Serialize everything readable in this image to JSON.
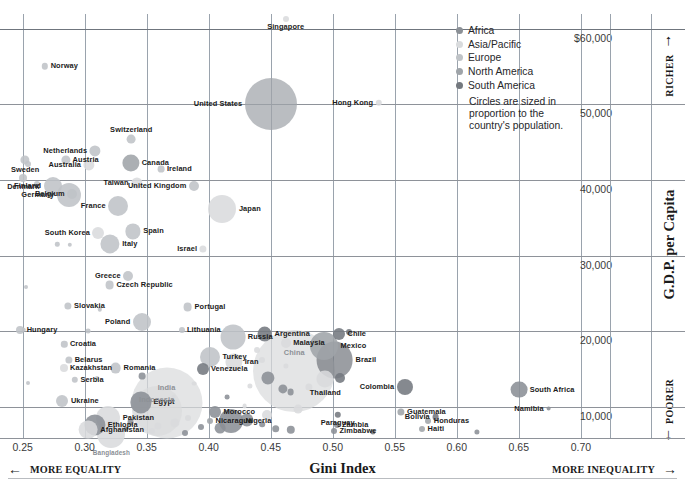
{
  "chart_data": {
    "type": "scatter",
    "title": "",
    "xlabel": "Gini Index",
    "ylabel": "G.D.P. per Capita",
    "xlim": [
      0.2317,
      0.7235
    ],
    "ylim": [
      5900,
      61930
    ],
    "xticks": [
      0.25,
      0.3,
      0.35,
      0.4,
      0.45,
      0.5,
      0.55,
      0.6,
      0.65,
      0.7
    ],
    "xticklabels": [
      "0.25",
      "0.30",
      "0.35",
      "0.40",
      "0.45",
      "0.50",
      "0.55",
      "0.60",
      "0.65",
      "0.70"
    ],
    "yticks": [
      60000,
      50000,
      40000,
      30000,
      20000,
      10000
    ],
    "yticklabels": [
      "$60,000",
      "50,000",
      "40,000",
      "30,000",
      "20,000",
      "10,000"
    ],
    "grid": true,
    "legend_position": "top-right",
    "size_note": "Circles are sized in proportion to the country's population.",
    "left_direction": "MORE EQUALITY",
    "right_direction": "MORE INEQUALITY",
    "top_direction": "RICHER",
    "bottom_direction": "POORER",
    "series": [
      {
        "name": "Africa",
        "color": "#8b9096"
      },
      {
        "name": "Asia/Pacific",
        "color": "#d9dbdd"
      },
      {
        "name": "Europe",
        "color": "#bfc3c7"
      },
      {
        "name": "North America",
        "color": "#9fa4a9"
      },
      {
        "name": "South America",
        "color": "#74797f"
      }
    ],
    "points": [
      {
        "name": "Singapore",
        "x": 0.462,
        "y": 61300,
        "r": 3.0,
        "g": "Asia/Pacific",
        "lp": "below",
        "i": false
      },
      {
        "name": "Norway",
        "x": 0.268,
        "y": 55000,
        "r": 3.2,
        "g": "Europe",
        "lp": "right",
        "i": false
      },
      {
        "name": "United States",
        "x": 0.45,
        "y": 50000,
        "r": 26.0,
        "g": "North America",
        "lp": "left",
        "i": false
      },
      {
        "name": "Hong Kong",
        "x": 0.537,
        "y": 50200,
        "r": 3.2,
        "g": "Asia/Pacific",
        "lp": "left",
        "i": false
      },
      {
        "name": "Switzerland",
        "x": 0.3375,
        "y": 45400,
        "r": 4.4,
        "g": "Europe",
        "lp": "above",
        "i": false
      },
      {
        "name": "Netherlands",
        "x": 0.3085,
        "y": 43800,
        "r": 5.6,
        "g": "Europe",
        "lp": "left",
        "i": false
      },
      {
        "name": "Austria",
        "x": 0.2845,
        "y": 42700,
        "r": 4.6,
        "g": "Europe",
        "lp": "right",
        "i": false
      },
      {
        "name": "Canada",
        "x": 0.337,
        "y": 42300,
        "r": 8.6,
        "g": "North America",
        "lp": "right",
        "i": false
      },
      {
        "name": "Sweden",
        "x": 0.252,
        "y": 42600,
        "r": 4.6,
        "g": "Europe",
        "lp": "below",
        "i": false
      },
      {
        "name": "Australia",
        "x": 0.3035,
        "y": 42000,
        "r": 5.6,
        "g": "Asia/Pacific",
        "lp": "left",
        "i": false
      },
      {
        "name": "Ireland",
        "x": 0.3615,
        "y": 41400,
        "r": 3.4,
        "g": "Europe",
        "lp": "right",
        "i": false
      },
      {
        "name": "Denmark",
        "x": 0.2505,
        "y": 40200,
        "r": 4.0,
        "g": "Europe",
        "lp": "below",
        "i": false
      },
      {
        "name": "Finland",
        "x": 0.274,
        "y": 39200,
        "r": 9.0,
        "g": "Europe",
        "lp": "left",
        "i": false
      },
      {
        "name": "Taiwan",
        "x": 0.342,
        "y": 39600,
        "r": 5.6,
        "g": "Asia/Pacific",
        "lp": "left",
        "i": false
      },
      {
        "name": "United Kingdom",
        "x": 0.388,
        "y": 39200,
        "r": 5.0,
        "g": "Europe",
        "lp": "left",
        "i": false
      },
      {
        "name": "Belgium",
        "x": 0.29,
        "y": 38200,
        "r": 5.0,
        "g": "Europe",
        "lp": "left",
        "i": false
      },
      {
        "name": "Germany",
        "x": 0.287,
        "y": 38000,
        "r": 12.0,
        "g": "Europe",
        "lp": "left",
        "i": false
      },
      {
        "name": "France",
        "x": 0.327,
        "y": 36500,
        "r": 10.0,
        "g": "Europe",
        "lp": "left",
        "i": false
      },
      {
        "name": "Japan",
        "x": 0.411,
        "y": 36200,
        "r": 14.0,
        "g": "Asia/Pacific",
        "lp": "right",
        "i": false
      },
      {
        "name": "Spain",
        "x": 0.339,
        "y": 33200,
        "r": 7.6,
        "g": "Europe",
        "lp": "right",
        "i": false
      },
      {
        "name": "South Korea",
        "x": 0.311,
        "y": 33000,
        "r": 6.0,
        "g": "Asia/Pacific",
        "lp": "left",
        "i": false
      },
      {
        "name": "Italy",
        "x": 0.3205,
        "y": 31600,
        "r": 9.6,
        "g": "Europe",
        "lp": "right",
        "i": false
      },
      {
        "name": "Israel",
        "x": 0.3955,
        "y": 30900,
        "r": 3.6,
        "g": "Asia/Pacific",
        "lp": "left",
        "i": false
      },
      {
        "name": "Greece",
        "x": 0.335,
        "y": 27300,
        "r": 5.0,
        "g": "Europe",
        "lp": "left",
        "i": false
      },
      {
        "name": "Czech Republic",
        "x": 0.32,
        "y": 26100,
        "r": 4.4,
        "g": "Europe",
        "lp": "right",
        "i": false
      },
      {
        "name": "Slovakia",
        "x": 0.2865,
        "y": 23400,
        "r": 3.6,
        "g": "Europe",
        "lp": "right",
        "i": false
      },
      {
        "name": "Portugal",
        "x": 0.383,
        "y": 23200,
        "r": 4.4,
        "g": "Europe",
        "lp": "right",
        "i": false
      },
      {
        "name": "Poland",
        "x": 0.346,
        "y": 21200,
        "r": 9.0,
        "g": "Europe",
        "lp": "left",
        "i": false
      },
      {
        "name": "Hungary",
        "x": 0.248,
        "y": 20200,
        "r": 4.0,
        "g": "Europe",
        "lp": "right",
        "i": false
      },
      {
        "name": "Lithuania",
        "x": 0.378,
        "y": 20200,
        "r": 3.0,
        "g": "Europe",
        "lp": "right",
        "i": false
      },
      {
        "name": "Argentina",
        "x": 0.445,
        "y": 19600,
        "r": 7.4,
        "g": "South America",
        "lp": "right",
        "i": false
      },
      {
        "name": "Chile",
        "x": 0.505,
        "y": 19600,
        "r": 6.0,
        "g": "South America",
        "lp": "right",
        "i": false
      },
      {
        "name": "Russia",
        "x": 0.4195,
        "y": 19200,
        "r": 12.4,
        "g": "Europe",
        "lp": "right",
        "i": false
      },
      {
        "name": "Mexico",
        "x": 0.493,
        "y": 18100,
        "r": 14.0,
        "g": "North America",
        "lp": "right",
        "i": false
      },
      {
        "name": "Malaysia",
        "x": 0.462,
        "y": 18400,
        "r": 5.0,
        "g": "Asia/Pacific",
        "lp": "right",
        "i": false
      },
      {
        "name": "Croatia",
        "x": 0.2835,
        "y": 18300,
        "r": 3.2,
        "g": "Europe",
        "lp": "right",
        "i": false
      },
      {
        "name": "Brazil",
        "x": 0.5015,
        "y": 16200,
        "r": 18.4,
        "g": "South America",
        "lp": "right",
        "i": false
      },
      {
        "name": "Turkey",
        "x": 0.401,
        "y": 16600,
        "r": 10.0,
        "g": "Europe",
        "lp": "right",
        "i": false
      },
      {
        "name": "Iran",
        "x": 0.42,
        "y": 16000,
        "r": 8.6,
        "g": "Asia/Pacific",
        "lp": "right",
        "i": false
      },
      {
        "name": "Belarus",
        "x": 0.287,
        "y": 16200,
        "r": 3.6,
        "g": "Europe",
        "lp": "right",
        "i": false
      },
      {
        "name": "Kazakhstan",
        "x": 0.283,
        "y": 15100,
        "r": 4.0,
        "g": "Asia/Pacific",
        "lp": "right",
        "i": false
      },
      {
        "name": "Romania",
        "x": 0.325,
        "y": 15100,
        "r": 5.4,
        "g": "Europe",
        "lp": "right",
        "i": false
      },
      {
        "name": "Venezuela",
        "x": 0.395,
        "y": 15000,
        "r": 6.0,
        "g": "South America",
        "lp": "right",
        "i": false
      },
      {
        "name": "Colombia",
        "x": 0.558,
        "y": 12600,
        "r": 8.0,
        "g": "South America",
        "lp": "left",
        "i": false
      },
      {
        "name": "Serbia",
        "x": 0.292,
        "y": 13600,
        "r": 3.2,
        "g": "Europe",
        "lp": "right",
        "i": false
      },
      {
        "name": "South Africa",
        "x": 0.65,
        "y": 12300,
        "r": 8.4,
        "g": "Africa",
        "lp": "right",
        "i": false
      },
      {
        "name": "Thailand",
        "x": 0.494,
        "y": 13700,
        "r": 8.6,
        "g": "Asia/Pacific",
        "lp": "below",
        "i": false
      },
      {
        "name": "China",
        "x": 0.469,
        "y": 14800,
        "r": 41.0,
        "g": "Asia/Pacific",
        "lp": "inside",
        "i": false
      },
      {
        "name": "Ukraine",
        "x": 0.282,
        "y": 10800,
        "r": 6.0,
        "g": "Europe",
        "lp": "right",
        "i": false
      },
      {
        "name": "Egypt",
        "x": 0.345,
        "y": 10600,
        "r": 10.6,
        "g": "Africa",
        "lp": "right",
        "i": false
      },
      {
        "name": "Morocco",
        "x": 0.405,
        "y": 9400,
        "r": 6.0,
        "g": "Africa",
        "lp": "right",
        "i": false
      },
      {
        "name": "India",
        "x": 0.366,
        "y": 10500,
        "r": 35.5,
        "g": "Asia/Pacific",
        "lp": "inside",
        "i": false
      },
      {
        "name": "Indonesia",
        "x": 0.358,
        "y": 9500,
        "r": 25.0,
        "g": "Asia/Pacific",
        "lp": "inside",
        "i": false
      },
      {
        "name": "Nigeria",
        "x": 0.418,
        "y": 8200,
        "r": 12.0,
        "g": "Africa",
        "lp": "right",
        "i": false
      },
      {
        "name": "Guatemala",
        "x": 0.555,
        "y": 9400,
        "r": 3.6,
        "g": "North America",
        "lp": "right",
        "i": false
      },
      {
        "name": "Nicaragua",
        "x": 0.401,
        "y": 8200,
        "r": 3.0,
        "g": "North America",
        "lp": "right",
        "i": false
      },
      {
        "name": "Paraguay",
        "x": 0.504,
        "y": 9000,
        "r": 3.2,
        "g": "South America",
        "lp": "below",
        "i": false
      },
      {
        "name": "Bolivia",
        "x": 0.583,
        "y": 8700,
        "r": 3.4,
        "g": "South America",
        "lp": "left",
        "i": false
      },
      {
        "name": "Honduras",
        "x": 0.577,
        "y": 8100,
        "r": 3.0,
        "g": "North America",
        "lp": "right",
        "i": false
      },
      {
        "name": "Pakistan",
        "x": 0.319,
        "y": 8600,
        "r": 12.0,
        "g": "Asia/Pacific",
        "lp": "right",
        "i": false
      },
      {
        "name": "Namibia",
        "x": 0.674,
        "y": 9800,
        "r": 2.4,
        "g": "Africa",
        "lp": "left",
        "i": false
      },
      {
        "name": "Ethiopia",
        "x": 0.308,
        "y": 7600,
        "r": 10.6,
        "g": "Africa",
        "lp": "right",
        "i": false
      },
      {
        "name": "Zambia",
        "x": 0.503,
        "y": 7600,
        "r": 3.0,
        "g": "Africa",
        "lp": "right",
        "i": false
      },
      {
        "name": "Afghanistan",
        "x": 0.303,
        "y": 7000,
        "r": 9.4,
        "g": "Asia/Pacific",
        "lp": "right",
        "i": false
      },
      {
        "name": "Zimbabwe",
        "x": 0.501,
        "y": 6800,
        "r": 3.0,
        "g": "Africa",
        "lp": "right",
        "i": false
      },
      {
        "name": "Haiti",
        "x": 0.572,
        "y": 7100,
        "r": 3.0,
        "g": "North America",
        "lp": "right",
        "i": false
      },
      {
        "name": "Bangladesh",
        "x": 0.3215,
        "y": 6500,
        "r": 14.0,
        "g": "Asia/Pacific",
        "lp": "belowsmall",
        "i": false
      }
    ],
    "unlabeled_points": [
      {
        "x": 0.254,
        "y": 42100,
        "r": 3.0,
        "g": "Europe"
      },
      {
        "x": 0.2615,
        "y": 39500,
        "r": 3.0,
        "g": "Europe"
      },
      {
        "x": 0.278,
        "y": 31500,
        "r": 2.2,
        "g": "Europe"
      },
      {
        "x": 0.288,
        "y": 31400,
        "r": 2.2,
        "g": "Europe"
      },
      {
        "x": 0.253,
        "y": 25900,
        "r": 2.0,
        "g": "Europe"
      },
      {
        "x": 0.251,
        "y": 20200,
        "r": 2.2,
        "g": "Europe"
      },
      {
        "x": 0.312,
        "y": 22900,
        "r": 2.2,
        "g": "Europe"
      },
      {
        "x": 0.303,
        "y": 20000,
        "r": 2.4,
        "g": "Europe"
      },
      {
        "x": 0.346,
        "y": 14100,
        "r": 3.4,
        "g": "Africa"
      },
      {
        "x": 0.388,
        "y": 13100,
        "r": 2.4,
        "g": "Asia/Pacific"
      },
      {
        "x": 0.439,
        "y": 17600,
        "r": 3.0,
        "g": "Asia/Pacific"
      },
      {
        "x": 0.443,
        "y": 16200,
        "r": 3.0,
        "g": "Asia/Pacific"
      },
      {
        "x": 0.462,
        "y": 15400,
        "r": 2.6,
        "g": "Asia/Pacific"
      },
      {
        "x": 0.433,
        "y": 12800,
        "r": 2.6,
        "g": "Asia/Pacific"
      },
      {
        "x": 0.448,
        "y": 13900,
        "r": 6.6,
        "g": "Africa"
      },
      {
        "x": 0.46,
        "y": 12400,
        "r": 4.6,
        "g": "Africa"
      },
      {
        "x": 0.466,
        "y": 12000,
        "r": 3.4,
        "g": "Africa"
      },
      {
        "x": 0.481,
        "y": 12600,
        "r": 3.6,
        "g": "Asia/Pacific"
      },
      {
        "x": 0.506,
        "y": 13800,
        "r": 5.0,
        "g": "South America"
      },
      {
        "x": 0.513,
        "y": 19900,
        "r": 3.0,
        "g": "South America"
      },
      {
        "x": 0.415,
        "y": 11300,
        "r": 2.4,
        "g": "Africa"
      },
      {
        "x": 0.429,
        "y": 10100,
        "r": 2.4,
        "g": "Asia/Pacific"
      },
      {
        "x": 0.472,
        "y": 9700,
        "r": 4.4,
        "g": "Asia/Pacific"
      },
      {
        "x": 0.447,
        "y": 9000,
        "r": 5.0,
        "g": "Asia/Pacific"
      },
      {
        "x": 0.431,
        "y": 8300,
        "r": 6.6,
        "g": "Africa"
      },
      {
        "x": 0.443,
        "y": 7700,
        "r": 2.8,
        "g": "Africa"
      },
      {
        "x": 0.454,
        "y": 7100,
        "r": 3.8,
        "g": "Africa"
      },
      {
        "x": 0.466,
        "y": 7000,
        "r": 4.2,
        "g": "Africa"
      },
      {
        "x": 0.409,
        "y": 7200,
        "r": 5.4,
        "g": "Africa"
      },
      {
        "x": 0.394,
        "y": 7300,
        "r": 3.0,
        "g": "Africa"
      },
      {
        "x": 0.373,
        "y": 7900,
        "r": 4.6,
        "g": "Asia/Pacific"
      },
      {
        "x": 0.383,
        "y": 8500,
        "r": 3.0,
        "g": "Asia/Pacific"
      },
      {
        "x": 0.359,
        "y": 7500,
        "r": 3.6,
        "g": "Asia/Pacific"
      },
      {
        "x": 0.337,
        "y": 8000,
        "r": 3.4,
        "g": "Africa"
      },
      {
        "x": 0.333,
        "y": 7100,
        "r": 2.6,
        "g": "Africa"
      },
      {
        "x": 0.354,
        "y": 6800,
        "r": 3.0,
        "g": "Asia/Pacific"
      },
      {
        "x": 0.381,
        "y": 6600,
        "r": 3.0,
        "g": "Africa"
      },
      {
        "x": 0.532,
        "y": 6700,
        "r": 2.6,
        "g": "South America"
      },
      {
        "x": 0.616,
        "y": 6700,
        "r": 2.6,
        "g": "Africa"
      },
      {
        "x": 0.254,
        "y": 13200,
        "r": 2.0,
        "g": "Europe"
      },
      {
        "x": 0.31,
        "y": 13900,
        "r": 2.0,
        "g": "Europe"
      },
      {
        "x": 0.372,
        "y": 11300,
        "r": 2.2,
        "g": "Asia/Pacific"
      },
      {
        "x": 0.363,
        "y": 12400,
        "r": 2.2,
        "g": "Asia/Pacific"
      }
    ]
  }
}
